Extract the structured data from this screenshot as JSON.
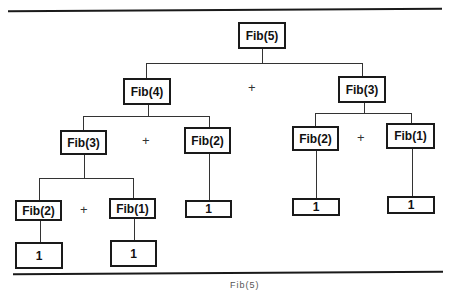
{
  "diagram": {
    "nodes": [
      {
        "id": "n5",
        "label": "Fib(5)"
      },
      {
        "id": "n4",
        "label": "Fib(4)"
      },
      {
        "id": "n3r",
        "label": "Fib(3)"
      },
      {
        "id": "n3l",
        "label": "Fib(3)"
      },
      {
        "id": "n2a",
        "label": "Fib(2)"
      },
      {
        "id": "n2b",
        "label": "Fib(2)"
      },
      {
        "id": "n1b",
        "label": "Fib(1)"
      },
      {
        "id": "n2c",
        "label": "Fib(2)"
      },
      {
        "id": "n1c",
        "label": "Fib(1)"
      },
      {
        "id": "l1",
        "label": "1"
      },
      {
        "id": "l2",
        "label": "1"
      },
      {
        "id": "l3",
        "label": "1"
      },
      {
        "id": "l4",
        "label": "1"
      },
      {
        "id": "l5",
        "label": "1"
      }
    ],
    "plus": "+",
    "caption": "Fib(5)"
  }
}
